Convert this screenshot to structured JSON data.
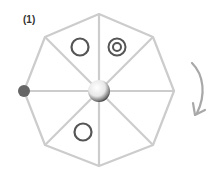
{
  "figure": {
    "label": "(1)",
    "shape": "octagon",
    "sectors": 8,
    "colors": {
      "edge": "#cccccc",
      "marker": "#555555",
      "dot": "#666666",
      "arrow": "#a8a8a8"
    },
    "markers": [
      {
        "type": "ring",
        "sector": "top-left"
      },
      {
        "type": "double-ring",
        "sector": "top-right"
      },
      {
        "type": "ring",
        "sector": "bottom-left"
      }
    ],
    "pivot": "center-sphere",
    "anchor_dot": "left-vertex",
    "rotation_arrow": "clockwise"
  }
}
